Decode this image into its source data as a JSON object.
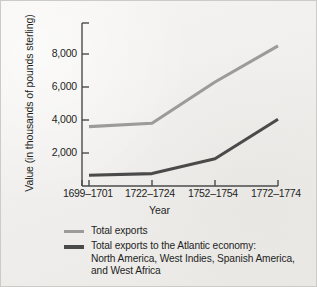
{
  "chart_data": {
    "type": "line",
    "title": "",
    "xlabel": "Year",
    "ylabel": "Value (in thousands of pounds sterling)",
    "categories": [
      "1699–1701",
      "1722–1724",
      "1752–1754",
      "1772–1774"
    ],
    "ylim": [
      0,
      9000
    ],
    "yticks": [
      2000,
      4000,
      6000,
      8000
    ],
    "ytick_labels": [
      "2,000",
      "4,000",
      "6,000",
      "8,000"
    ],
    "grid": false,
    "legend_position": "below",
    "series": [
      {
        "name": "Total exports",
        "color": "#9b9b99",
        "values": [
          3600,
          3800,
          6300,
          8500
        ]
      },
      {
        "name": "Total exports to the Atlantic economy: North America, West Indies, Spanish America, and West Africa",
        "color": "#4a4a4a",
        "values": [
          650,
          750,
          1650,
          4050
        ]
      }
    ]
  },
  "axes": {
    "ylabel": "Value (in thousands of pounds sterling)",
    "xlabel": "Year",
    "ytick_labels": [
      "8,000",
      "6,000",
      "4,000",
      "2,000"
    ],
    "xtick_labels": [
      "1699–1701",
      "1722–1724",
      "1752–1754",
      "1772–1774"
    ],
    "axis_color": "#4b4b4b"
  },
  "legend": {
    "items": [
      {
        "label": "Total exports",
        "sub1": "",
        "sub2": "",
        "color": "#9b9b99"
      },
      {
        "label": "Total exports to the Atlantic economy:",
        "sub1": "North America, West Indies, Spanish America,",
        "sub2": "and West Africa",
        "color": "#4a4a4a"
      }
    ]
  },
  "colors": {
    "background": "#f2f1ef",
    "border": "#cdcbc7",
    "text": "#231f1d",
    "series_light": "#9b9b99",
    "series_dark": "#4a4a4a"
  }
}
